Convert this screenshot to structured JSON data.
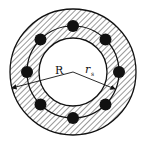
{
  "diagram": {
    "type": "annular-cross-section-with-bolt-circle",
    "labels": {
      "outer_radius": "R",
      "bolt_radius_main": "r",
      "bolt_radius_sub": "s"
    },
    "geometry": {
      "center": [
        73,
        72
      ],
      "outer_radius_px": 63,
      "inner_radius_px": 34,
      "bolt_circle_radius_px": 46,
      "bolt_count": 8,
      "bolt_dot_radius_px": 6
    },
    "colors": {
      "line": "#111111",
      "hatch": "#333333",
      "background": "#ffffff"
    }
  }
}
